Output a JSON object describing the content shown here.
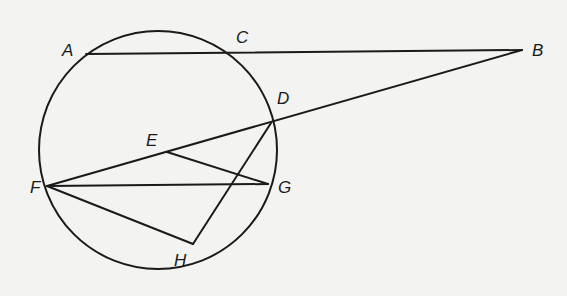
{
  "diagram": {
    "type": "geometry-circle-secants-chords",
    "circle": {
      "cx": 158,
      "cy": 150,
      "r": 119
    },
    "points": {
      "A": {
        "x": 86,
        "y": 54,
        "label": "A",
        "lx": 62,
        "ly": 56
      },
      "B": {
        "x": 522,
        "y": 50,
        "label": "B",
        "lx": 532,
        "ly": 56
      },
      "C": {
        "x": 230,
        "y": 53,
        "label": "C",
        "lx": 236,
        "ly": 43
      },
      "D": {
        "x": 271,
        "y": 123,
        "label": "D",
        "lx": 277,
        "ly": 104
      },
      "E": {
        "x": 167,
        "y": 152,
        "label": "E",
        "lx": 146,
        "ly": 146
      },
      "F": {
        "x": 47,
        "y": 186,
        "label": "F",
        "lx": 30,
        "ly": 193
      },
      "G": {
        "x": 268,
        "y": 184,
        "label": "G",
        "lx": 278,
        "ly": 193
      },
      "H": {
        "x": 193,
        "y": 244,
        "label": "H",
        "lx": 174,
        "ly": 266
      }
    },
    "segments": [
      [
        "A",
        "B"
      ],
      [
        "B",
        "F"
      ],
      [
        "E",
        "G"
      ],
      [
        "F",
        "G"
      ],
      [
        "F",
        "H"
      ],
      [
        "H",
        "D"
      ]
    ],
    "labels": [
      "A",
      "B",
      "C",
      "D",
      "E",
      "F",
      "G",
      "H"
    ]
  }
}
